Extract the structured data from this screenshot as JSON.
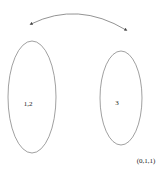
{
  "diagram": {
    "partitions": [
      {
        "label": "1,2"
      },
      {
        "label": "3"
      }
    ],
    "swap_arrow": {
      "direction": "bidirectional"
    },
    "state_label": "(0,1,1)",
    "colors": {
      "stroke": "#555555",
      "text": "#222222",
      "background": "#ffffff"
    }
  }
}
